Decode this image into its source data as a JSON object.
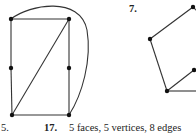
{
  "exercises": [
    {
      "number": "5.",
      "figure": {
        "type": "planar-graph",
        "vertices": [
          [
            11,
            19
          ],
          [
            69,
            19
          ],
          [
            11,
            68
          ],
          [
            69,
            68
          ],
          [
            12,
            115
          ],
          [
            69,
            115
          ]
        ],
        "edges": [
          [
            0,
            1
          ],
          [
            0,
            2
          ],
          [
            2,
            4
          ],
          [
            4,
            5
          ],
          [
            5,
            3
          ],
          [
            3,
            1
          ],
          [
            4,
            1
          ]
        ],
        "curved_edges": [
          {
            "from": 0,
            "to": 5,
            "via": "outer-right"
          }
        ]
      }
    },
    {
      "number": "7.",
      "figure": {
        "type": "planar-graph",
        "vertices": [
          [
            193,
            7
          ],
          [
            150,
            39
          ],
          [
            194,
            70
          ],
          [
            167,
            91
          ]
        ],
        "edges": [
          [
            0,
            1
          ],
          [
            1,
            3
          ],
          [
            3,
            2
          ],
          [
            3,
            "offscreen-right"
          ],
          [
            0,
            "offscreen-right"
          ],
          [
            2,
            "offscreen-right"
          ]
        ]
      }
    },
    {
      "number": "17.",
      "answer": "5 faces, 5 vertices, 8 edges"
    }
  ],
  "colors": {
    "line": "#333333",
    "vertex": "#111111",
    "text": "#222222"
  }
}
